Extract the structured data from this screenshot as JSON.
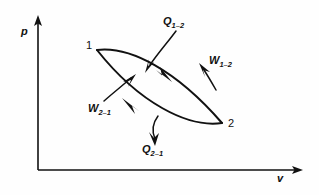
{
  "figure": {
    "type": "thermodynamic-cycle-pv-diagram",
    "background_color": "#fefefe",
    "ink_color": "#111111"
  },
  "axes": {
    "y": {
      "label": "p",
      "name": "pressure-axis",
      "origin": [
        38,
        170
      ],
      "tip": [
        38,
        18
      ],
      "arrow": "up"
    },
    "x": {
      "label": "v",
      "name": "volume-axis",
      "origin": [
        38,
        170
      ],
      "tip": [
        302,
        170
      ],
      "arrow": "right"
    }
  },
  "states": [
    {
      "id": "1",
      "label": "1",
      "point": [
        97,
        50
      ]
    },
    {
      "id": "2",
      "label": "2",
      "point": [
        222,
        123
      ]
    }
  ],
  "cycle": {
    "name": "closed-cycle-loop",
    "shape": "lens",
    "upper_path_direction": "1-to-2",
    "lower_path_direction": "2-to-1",
    "upper_path": "M 97 50 C 130 47, 175 70, 222 123",
    "lower_path": "M 222 123 C 188 127, 140 104, 97 50"
  },
  "annotations": [
    {
      "id": "q12",
      "label_main": "Q",
      "label_sub": "1–2",
      "full": "Q1-2",
      "meaning": "heat-added-1-to-2",
      "leader": "M 176 33 C 168 44, 158 54, 148 66",
      "arrow_at": [
        146,
        70
      ],
      "arrow_dir": "down-left"
    },
    {
      "id": "w12",
      "label_main": "W",
      "label_sub": "1–2",
      "full": "W1-2",
      "meaning": "work-output-1-to-2",
      "leader": "M 214 87 C 211 82, 208 76, 204 70",
      "arrow_at": [
        201,
        66
      ],
      "arrow_dir": "up-right"
    },
    {
      "id": "w21",
      "label_main": "W",
      "label_sub": "2–1",
      "full": "W2-1",
      "meaning": "work-input-2-to-1",
      "leader": "M 106 100 C 114 93, 122 86, 130 79",
      "arrow_at": [
        134,
        76
      ],
      "arrow_dir": "up-right"
    },
    {
      "id": "q21",
      "label_main": "Q",
      "label_sub": "2–1",
      "full": "Q2-1",
      "meaning": "heat-rejected-2-to-1",
      "leader": "M 157 117 C 152 125, 153 133, 156 140",
      "arrow_at": [
        157,
        144
      ],
      "arrow_dir": "down"
    }
  ],
  "curve_arrowheads": [
    {
      "on": "upper-path",
      "at": [
        163,
        73
      ],
      "dir": "down-right"
    },
    {
      "on": "lower-path",
      "at": [
        133,
        108
      ],
      "dir": "up-left"
    }
  ]
}
